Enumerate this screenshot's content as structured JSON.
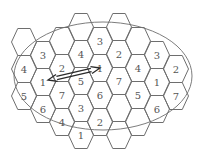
{
  "diagram": {
    "ellipse": {
      "cx": 103,
      "cy": 76,
      "rx": 89,
      "ry": 54
    },
    "hex": {
      "half_width": 12.5,
      "half_height": 13.5
    },
    "cells": [
      {
        "x": 24,
        "y": 42,
        "label": ""
      },
      {
        "x": 24,
        "y": 69,
        "label": "4"
      },
      {
        "x": 24,
        "y": 96,
        "label": "5"
      },
      {
        "x": 43,
        "y": 55,
        "label": "3"
      },
      {
        "x": 43,
        "y": 82,
        "label": "1"
      },
      {
        "x": 43,
        "y": 109,
        "label": "6"
      },
      {
        "x": 62,
        "y": 41,
        "label": ""
      },
      {
        "x": 62,
        "y": 68,
        "label": "2"
      },
      {
        "x": 62,
        "y": 95,
        "label": "7"
      },
      {
        "x": 62,
        "y": 122,
        "label": "4"
      },
      {
        "x": 81,
        "y": 27,
        "label": ""
      },
      {
        "x": 81,
        "y": 54,
        "label": "4"
      },
      {
        "x": 81,
        "y": 81,
        "label": "5"
      },
      {
        "x": 81,
        "y": 108,
        "label": "3"
      },
      {
        "x": 81,
        "y": 135,
        "label": "1"
      },
      {
        "x": 100,
        "y": 41,
        "label": "3"
      },
      {
        "x": 100,
        "y": 68,
        "label": "1"
      },
      {
        "x": 100,
        "y": 95,
        "label": "6"
      },
      {
        "x": 100,
        "y": 122,
        "label": "2"
      },
      {
        "x": 119,
        "y": 27,
        "label": ""
      },
      {
        "x": 119,
        "y": 54,
        "label": "2"
      },
      {
        "x": 119,
        "y": 81,
        "label": "7"
      },
      {
        "x": 119,
        "y": 108,
        "label": ""
      },
      {
        "x": 119,
        "y": 135,
        "label": ""
      },
      {
        "x": 138,
        "y": 41,
        "label": ""
      },
      {
        "x": 138,
        "y": 68,
        "label": "4"
      },
      {
        "x": 138,
        "y": 95,
        "label": "5"
      },
      {
        "x": 138,
        "y": 122,
        "label": ""
      },
      {
        "x": 157,
        "y": 55,
        "label": "3"
      },
      {
        "x": 157,
        "y": 82,
        "label": "1"
      },
      {
        "x": 157,
        "y": 109,
        "label": "6"
      },
      {
        "x": 176,
        "y": 69,
        "label": "2"
      },
      {
        "x": 176,
        "y": 96,
        "label": "7"
      }
    ],
    "arrow": {
      "from": {
        "x": 48,
        "y": 80
      },
      "to": {
        "x": 100,
        "y": 68
      },
      "style": "double-headed",
      "description": "reuse distance between co-channel cells labeled 1"
    },
    "colors": {
      "stroke": "#6e6e6e",
      "label": "#555555",
      "arrow": "#2a2a2a",
      "background": "#ffffff"
    }
  }
}
